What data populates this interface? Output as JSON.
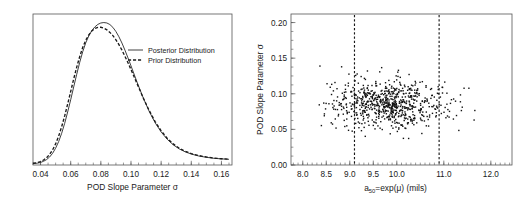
{
  "chart_data": [
    {
      "type": "line",
      "id": "left-density-plot",
      "title": "",
      "xlabel": "POD Slope Parameter σ",
      "ylabel": "",
      "xlim": [
        0.035,
        0.167
      ],
      "ylim": [
        0,
        1.06
      ],
      "grid": false,
      "xticks": [
        0.04,
        0.06,
        0.08,
        0.1,
        0.12,
        0.14,
        0.16
      ],
      "xticklabels": [
        "0.04",
        "0.06",
        "0.08",
        "0.10",
        "0.12",
        "0.14",
        "0.16"
      ],
      "yticks": [],
      "yticklabels": [],
      "legend_position": "upper-right-inside",
      "series": [
        {
          "name": "Posterior Distribution",
          "style": "solid",
          "color": "#2a2a2a",
          "x": [
            0.035,
            0.038,
            0.04,
            0.042,
            0.044,
            0.046,
            0.048,
            0.05,
            0.052,
            0.054,
            0.056,
            0.058,
            0.06,
            0.062,
            0.064,
            0.066,
            0.068,
            0.07,
            0.072,
            0.074,
            0.076,
            0.078,
            0.08,
            0.082,
            0.084,
            0.086,
            0.088,
            0.09,
            0.092,
            0.094,
            0.096,
            0.098,
            0.1,
            0.104,
            0.108,
            0.112,
            0.116,
            0.12,
            0.124,
            0.128,
            0.132,
            0.136,
            0.14,
            0.145,
            0.15,
            0.155,
            0.16,
            0.165
          ],
          "y": [
            0.01,
            0.013,
            0.018,
            0.026,
            0.038,
            0.056,
            0.082,
            0.118,
            0.164,
            0.222,
            0.292,
            0.372,
            0.458,
            0.548,
            0.637,
            0.721,
            0.796,
            0.858,
            0.906,
            0.943,
            0.969,
            0.987,
            0.997,
            1.0,
            0.997,
            0.986,
            0.966,
            0.937,
            0.9,
            0.856,
            0.806,
            0.752,
            0.696,
            0.582,
            0.474,
            0.378,
            0.297,
            0.232,
            0.181,
            0.142,
            0.113,
            0.092,
            0.077,
            0.063,
            0.054,
            0.047,
            0.043,
            0.04
          ]
        },
        {
          "name": "Prior Distribution",
          "style": "dashed",
          "color": "#1a1a1a",
          "x": [
            0.035,
            0.038,
            0.04,
            0.042,
            0.044,
            0.046,
            0.048,
            0.05,
            0.052,
            0.054,
            0.056,
            0.058,
            0.06,
            0.062,
            0.064,
            0.066,
            0.068,
            0.07,
            0.072,
            0.074,
            0.076,
            0.078,
            0.08,
            0.082,
            0.084,
            0.086,
            0.088,
            0.09,
            0.092,
            0.094,
            0.096,
            0.098,
            0.1,
            0.104,
            0.108,
            0.112,
            0.116,
            0.12,
            0.124,
            0.128,
            0.132,
            0.136,
            0.14,
            0.145,
            0.15,
            0.155,
            0.16,
            0.165
          ],
          "y": [
            0.012,
            0.017,
            0.024,
            0.035,
            0.051,
            0.074,
            0.106,
            0.148,
            0.202,
            0.268,
            0.344,
            0.428,
            0.516,
            0.604,
            0.687,
            0.762,
            0.826,
            0.876,
            0.913,
            0.941,
            0.958,
            0.966,
            0.967,
            0.961,
            0.949,
            0.931,
            0.908,
            0.879,
            0.845,
            0.806,
            0.763,
            0.718,
            0.67,
            0.572,
            0.474,
            0.384,
            0.305,
            0.24,
            0.188,
            0.148,
            0.118,
            0.096,
            0.08,
            0.066,
            0.056,
            0.049,
            0.044,
            0.041
          ]
        }
      ]
    },
    {
      "type": "scatter",
      "id": "right-scatter-plot",
      "title": "",
      "xlabel": "a50=exp(μ) (mils)",
      "xlabel_parts": {
        "a": "a",
        "sub": "50",
        "rest": "=exp(μ) (mils)"
      },
      "ylabel": "POD Slope Parameter σ",
      "xlim": [
        7.75,
        12.45
      ],
      "ylim": [
        0.0,
        0.212
      ],
      "grid": false,
      "xticks": [
        8.0,
        8.5,
        9.0,
        9.5,
        10.0,
        11.0,
        12.0
      ],
      "xticklabels": [
        "8.0",
        "8.5",
        "9.0",
        "9.5",
        "10.0",
        "11.0",
        "12.0"
      ],
      "yticks": [
        0.0,
        0.05,
        0.1,
        0.15,
        0.2
      ],
      "yticklabels": [
        "0.00",
        "0.05",
        "0.10",
        "0.15",
        "0.20"
      ],
      "marker": "square",
      "marker_size": 1.4,
      "marker_color": "#111111",
      "n_points": 760,
      "cloud": {
        "x_mean": 9.82,
        "x_sd": 0.62,
        "y_mean": 0.0855,
        "y_sd": 0.0165
      },
      "reference_lines": [
        {
          "name": "lower-bound",
          "orientation": "vertical",
          "value": 9.1,
          "style": "dashed"
        },
        {
          "name": "upper-bound",
          "orientation": "vertical",
          "value": 10.9,
          "style": "dashed"
        }
      ]
    }
  ],
  "figure": {
    "left_panel": {
      "name": "posterior-prior-density",
      "xlabel": "POD Slope Parameter σ",
      "legend": [
        {
          "label": "Posterior Distribution",
          "style": "solid"
        },
        {
          "label": "Prior Distribution",
          "style": "dashed"
        }
      ],
      "xticklabels": [
        "0.04",
        "0.06",
        "0.08",
        "0.10",
        "0.12",
        "0.14",
        "0.16"
      ]
    },
    "right_panel": {
      "name": "a50-sigma-scatter",
      "ylabel": "POD Slope Parameter σ",
      "xlabel_a": "a",
      "xlabel_sub": "50",
      "xlabel_rest": "=exp(μ) (mils)",
      "xticklabels": [
        "8.0",
        "8.5",
        "9.0",
        "9.5",
        "10.0",
        "11.0",
        "12.0"
      ],
      "yticklabels": [
        "0.00",
        "0.05",
        "0.10",
        "0.15",
        "0.20"
      ]
    }
  }
}
